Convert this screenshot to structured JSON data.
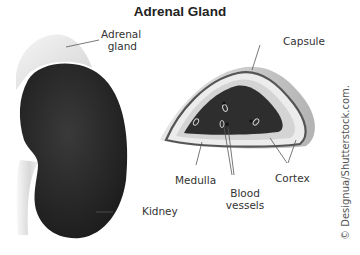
{
  "title": "Adrenal Gland",
  "labels": {
    "adrenal_gland_line1": "Adrenal",
    "adrenal_gland_line2": "gland",
    "kidney": "Kidney",
    "capsule": "Capsule",
    "medulla": "Medulla",
    "blood_vessels_line1": "Blood",
    "blood_vessels_line2": "vessels",
    "cortex": "Cortex"
  },
  "credit": "© Designua/Shutterstock.com.",
  "colors": {
    "kidney": "#2a2a2a",
    "medulla": "#2e2e2e",
    "cortex_inner": "#d6d6d6",
    "cortex_outer": "#e8e8e8",
    "capsule_outline": "#555555",
    "background": "#ffffff"
  }
}
